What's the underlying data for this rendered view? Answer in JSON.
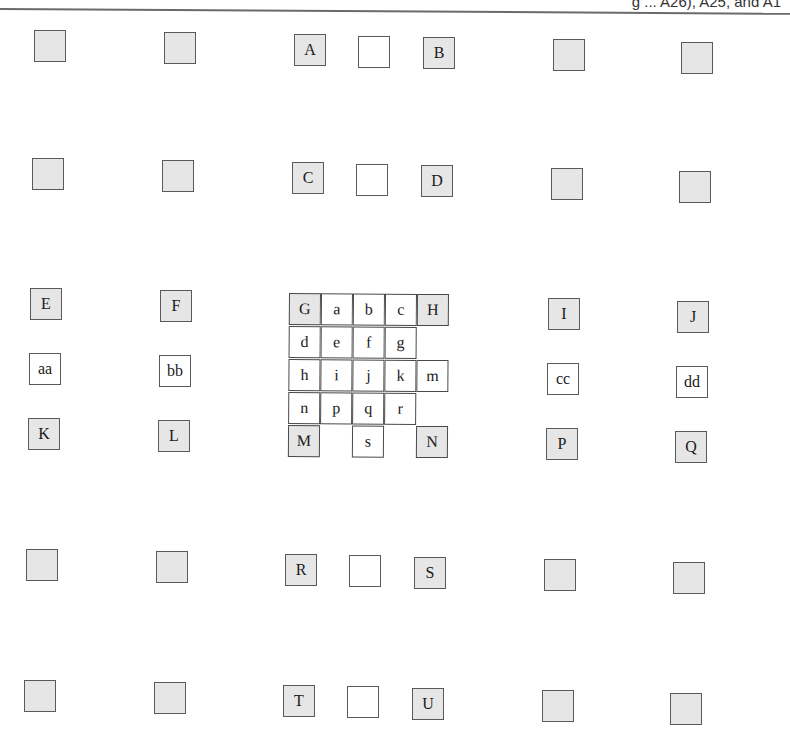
{
  "header": {
    "fragment": "g ... A26), A25, and A1"
  },
  "colors": {
    "shaded_fill": "#e6e6e6",
    "plain_fill": "#ffffff",
    "border": "#5a5a5a",
    "text": "#1a1a1a"
  },
  "boxes": [
    {
      "id": "top-l1",
      "label": "",
      "shaded": true,
      "x": 34,
      "y": 30
    },
    {
      "id": "top-l2",
      "label": "",
      "shaded": true,
      "x": 164,
      "y": 32
    },
    {
      "id": "A",
      "label": "A",
      "shaded": true,
      "x": 294,
      "y": 34
    },
    {
      "id": "AB-gap",
      "label": "",
      "shaded": false,
      "x": 358,
      "y": 36
    },
    {
      "id": "B",
      "label": "B",
      "shaded": true,
      "x": 423,
      "y": 37
    },
    {
      "id": "top-r1",
      "label": "",
      "shaded": true,
      "x": 553,
      "y": 39
    },
    {
      "id": "top-r2",
      "label": "",
      "shaded": true,
      "x": 681,
      "y": 42
    },
    {
      "id": "row2-l1",
      "label": "",
      "shaded": true,
      "x": 32,
      "y": 158
    },
    {
      "id": "row2-l2",
      "label": "",
      "shaded": true,
      "x": 162,
      "y": 160
    },
    {
      "id": "C",
      "label": "C",
      "shaded": true,
      "x": 292,
      "y": 162
    },
    {
      "id": "CD-gap",
      "label": "",
      "shaded": false,
      "x": 356,
      "y": 164
    },
    {
      "id": "D",
      "label": "D",
      "shaded": true,
      "x": 421,
      "y": 165
    },
    {
      "id": "row2-r1",
      "label": "",
      "shaded": true,
      "x": 551,
      "y": 168
    },
    {
      "id": "row2-r2",
      "label": "",
      "shaded": true,
      "x": 679,
      "y": 171
    },
    {
      "id": "E",
      "label": "E",
      "shaded": true,
      "x": 30,
      "y": 288
    },
    {
      "id": "F",
      "label": "F",
      "shaded": true,
      "x": 160,
      "y": 290
    },
    {
      "id": "I",
      "label": "I",
      "shaded": true,
      "x": 548,
      "y": 298
    },
    {
      "id": "J",
      "label": "J",
      "shaded": true,
      "x": 677,
      "y": 301
    },
    {
      "id": "aa",
      "label": "aa",
      "shaded": false,
      "x": 29,
      "y": 353
    },
    {
      "id": "bb",
      "label": "bb",
      "shaded": false,
      "x": 159,
      "y": 355
    },
    {
      "id": "cc",
      "label": "cc",
      "shaded": false,
      "x": 547,
      "y": 363
    },
    {
      "id": "dd",
      "label": "dd",
      "shaded": false,
      "x": 676,
      "y": 366
    },
    {
      "id": "K",
      "label": "K",
      "shaded": true,
      "x": 28,
      "y": 418
    },
    {
      "id": "L",
      "label": "L",
      "shaded": true,
      "x": 158,
      "y": 420
    },
    {
      "id": "P",
      "label": "P",
      "shaded": true,
      "x": 546,
      "y": 428
    },
    {
      "id": "Q",
      "label": "Q",
      "shaded": true,
      "x": 675,
      "y": 431
    },
    {
      "id": "row6-l1",
      "label": "",
      "shaded": true,
      "x": 26,
      "y": 549
    },
    {
      "id": "row6-l2",
      "label": "",
      "shaded": true,
      "x": 156,
      "y": 551
    },
    {
      "id": "R",
      "label": "R",
      "shaded": true,
      "x": 285,
      "y": 554
    },
    {
      "id": "RS-gap",
      "label": "",
      "shaded": false,
      "x": 349,
      "y": 555
    },
    {
      "id": "S",
      "label": "S",
      "shaded": true,
      "x": 414,
      "y": 557
    },
    {
      "id": "row6-r1",
      "label": "",
      "shaded": true,
      "x": 544,
      "y": 559
    },
    {
      "id": "row6-r2",
      "label": "",
      "shaded": true,
      "x": 673,
      "y": 562
    },
    {
      "id": "row7-l1",
      "label": "",
      "shaded": true,
      "x": 24,
      "y": 680
    },
    {
      "id": "row7-l2",
      "label": "",
      "shaded": true,
      "x": 154,
      "y": 682
    },
    {
      "id": "T",
      "label": "T",
      "shaded": true,
      "x": 283,
      "y": 685
    },
    {
      "id": "TU-gap",
      "label": "",
      "shaded": false,
      "x": 347,
      "y": 686
    },
    {
      "id": "U",
      "label": "U",
      "shaded": true,
      "x": 412,
      "y": 688
    },
    {
      "id": "row7-r1",
      "label": "",
      "shaded": true,
      "x": 542,
      "y": 690
    },
    {
      "id": "row7-r2",
      "label": "",
      "shaded": true,
      "x": 670,
      "y": 693
    }
  ],
  "central_grid": {
    "cell_size": 32,
    "rows": [
      [
        {
          "label": "G",
          "shaded": true
        },
        {
          "label": "a"
        },
        {
          "label": "b"
        },
        {
          "label": "c"
        },
        {
          "label": "H",
          "shaded": true
        }
      ],
      [
        {
          "label": "d"
        },
        {
          "label": "e"
        },
        {
          "label": "f"
        },
        {
          "label": "g"
        },
        null
      ],
      [
        {
          "label": "h"
        },
        {
          "label": "i"
        },
        {
          "label": "j"
        },
        {
          "label": "k"
        },
        {
          "label": "m"
        }
      ],
      [
        {
          "label": "n"
        },
        {
          "label": "p"
        },
        {
          "label": "q"
        },
        {
          "label": "r"
        },
        null
      ],
      [
        {
          "label": "M",
          "shaded": true
        },
        null,
        {
          "label": "s"
        },
        null,
        {
          "label": "N",
          "shaded": true
        }
      ]
    ]
  }
}
